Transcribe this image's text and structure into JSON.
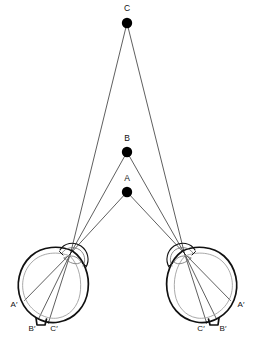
{
  "figure": {
    "background_color": "#ffffff",
    "ink_color": "#111111",
    "ray_color": "#1a1a1a",
    "retina_color": "#9a9a9a",
    "width": 255,
    "height": 338
  },
  "object_points": [
    {
      "id": "C",
      "label": "C",
      "x": 127,
      "y": 23,
      "radius": 5.2,
      "label_x": 127,
      "label_y": 11,
      "depth_rank": 3,
      "description": "farthest object point, highest on the page"
    },
    {
      "id": "B",
      "label": "B",
      "x": 127,
      "y": 152,
      "radius": 5.2,
      "label_x": 127,
      "label_y": 141,
      "depth_rank": 2,
      "description": "middle object point"
    },
    {
      "id": "A",
      "label": "A",
      "x": 127,
      "y": 192,
      "radius": 5.2,
      "label_x": 127,
      "label_y": 181,
      "depth_rank": 1,
      "description": "nearest object point, closest to the eyes"
    }
  ],
  "eyes": [
    {
      "id": "left-eye",
      "side": "left",
      "nodal_point": {
        "x": 70.5,
        "y": 253.5
      },
      "center": {
        "x": 56,
        "y": 280
      },
      "retinal_images": [
        {
          "id": "A-prime",
          "label": "A′",
          "point_x": 24.5,
          "point_y": 300.5,
          "label_x": 14,
          "label_y": 307
        },
        {
          "id": "B-prime",
          "label": "B′",
          "point_x": 38.5,
          "point_y": 319.0,
          "label_x": 32,
          "label_y": 331
        },
        {
          "id": "C-prime",
          "label": "C′",
          "point_x": 48.5,
          "point_y": 322.5,
          "label_x": 54,
          "label_y": 331
        }
      ]
    },
    {
      "id": "right-eye",
      "side": "right",
      "nodal_point": {
        "x": 184.5,
        "y": 253.5
      },
      "center": {
        "x": 199,
        "y": 280
      },
      "retinal_images": [
        {
          "id": "A-prime",
          "label": "A′",
          "point_x": 230.5,
          "point_y": 300.5,
          "label_x": 241,
          "label_y": 307
        },
        {
          "id": "B-prime",
          "label": "B′",
          "point_x": 216.5,
          "point_y": 319.0,
          "label_x": 223,
          "label_y": 331
        },
        {
          "id": "C-prime",
          "label": "C′",
          "point_x": 206.5,
          "point_y": 322.5,
          "label_x": 201,
          "label_y": 331
        }
      ]
    }
  ],
  "rays": [
    {
      "from": "C",
      "to_eye": "left-eye",
      "to_image": "C-prime"
    },
    {
      "from": "B",
      "to_eye": "left-eye",
      "to_image": "B-prime"
    },
    {
      "from": "A",
      "to_eye": "left-eye",
      "to_image": "A-prime"
    },
    {
      "from": "C",
      "to_eye": "right-eye",
      "to_image": "C-prime"
    },
    {
      "from": "B",
      "to_eye": "right-eye",
      "to_image": "B-prime"
    },
    {
      "from": "A",
      "to_eye": "right-eye",
      "to_image": "A-prime"
    }
  ]
}
